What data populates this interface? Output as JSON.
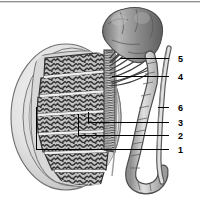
{
  "figure": {
    "width": 200,
    "height": 220,
    "background_color": "#ffffff"
  },
  "colors": {
    "outline": "#2b2b2b",
    "tunica_light": "#e9e9e9",
    "tunica_mid": "#cfcfcf",
    "tunica_shadow": "#b4b4b4",
    "lobule_fill": "#b9b9b9",
    "tubule_dark": "#3a3a3a",
    "septum": "#f2f2f2",
    "epididymis_fill": "#9b9b9b",
    "epididymis_light": "#c8c8c8",
    "epididymis_dark": "#6e6e6e",
    "duct_fill": "#d6d6d6",
    "leader_line": "#000000",
    "label_text": "#000000",
    "top_rule": "#6f6f6f"
  },
  "structures": [
    {
      "name": "testis-body",
      "description": "Ovoid testis shown in sagittal section with tunica albuginea and lobules"
    },
    {
      "name": "tunica-albuginea",
      "description": "Pale capsule ring surrounding the testis"
    },
    {
      "name": "seminiferous-tubules",
      "description": "Dark coiled tubules filling each lobule"
    },
    {
      "name": "rete-testis",
      "description": "Vertical striated channel along the posterior testis"
    },
    {
      "name": "efferent-ductules",
      "description": "Fan of fine ducts leading from rete testis to epididymal head"
    },
    {
      "name": "epididymis-head",
      "description": "Lobulated cap at the superior pole"
    },
    {
      "name": "epididymis-body-tail",
      "description": "Beaded convoluted duct descending along the posterior border"
    },
    {
      "name": "vas-deferens",
      "description": "Long straight duct ascending on the far right"
    }
  ],
  "labels": [
    {
      "id": "label-5",
      "text": "5",
      "x": 178,
      "y": 60,
      "leader_from_x": 169,
      "leader_to_x": 120,
      "leader_y": 58
    },
    {
      "id": "label-4",
      "text": "4",
      "x": 178,
      "y": 78,
      "leader_from_x": 169,
      "leader_to_x": 112,
      "leader_y": 76
    },
    {
      "id": "label-6",
      "text": "6",
      "x": 178,
      "y": 109,
      "leader_from_x": 169,
      "leader_to_x": 158,
      "leader_y": 107
    },
    {
      "id": "label-3",
      "text": "3",
      "x": 178,
      "y": 124,
      "leader_from_x": 169,
      "leader_to_x": 88,
      "leader_y": 122
    },
    {
      "id": "label-2",
      "text": "2",
      "x": 178,
      "y": 137,
      "leader_from_x": 169,
      "leader_to_x": 78,
      "leader_y": 135
    },
    {
      "id": "label-1",
      "text": "1",
      "x": 178,
      "y": 151,
      "leader_from_x": 169,
      "leader_to_x": 36,
      "leader_y": 149
    }
  ],
  "leader_brackets": [
    {
      "name": "bracket-label-1",
      "x": 36,
      "y_top": 107,
      "y_bottom": 149
    },
    {
      "name": "bracket-label-2",
      "x": 78,
      "y_top": 114,
      "y_bottom": 135
    },
    {
      "name": "bracket-label-3",
      "x": 88,
      "y_top": 112,
      "y_bottom": 122
    }
  ]
}
